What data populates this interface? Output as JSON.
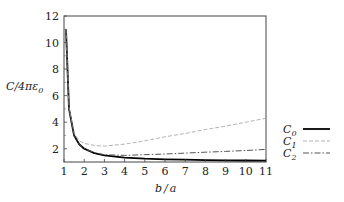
{
  "chart_data": {
    "type": "line",
    "title": "",
    "xlabel": "b/a",
    "ylabel": "C/4πε0",
    "xlim": [
      1,
      11
    ],
    "ylim": [
      1,
      12
    ],
    "grid": false,
    "legend_position": "right",
    "xticks": [
      1,
      2,
      3,
      4,
      5,
      6,
      7,
      8,
      9,
      10,
      11
    ],
    "yticks": [
      2,
      4,
      6,
      8,
      10,
      12
    ],
    "x": [
      1.1,
      1.25,
      1.5,
      1.75,
      2,
      2.5,
      3,
      4,
      5,
      6,
      7,
      8,
      9,
      10,
      11
    ],
    "series": [
      {
        "name": "C0",
        "style": "solid",
        "color": "#000000",
        "values": [
          11.0,
          5.0,
          3.0,
          2.33,
          2.0,
          1.67,
          1.5,
          1.33,
          1.25,
          1.2,
          1.17,
          1.14,
          1.13,
          1.11,
          1.1
        ]
      },
      {
        "name": "C1",
        "style": "dashed",
        "color": "#aaaaaa",
        "values": [
          11.0,
          5.1,
          3.2,
          2.6,
          2.4,
          2.25,
          2.2,
          2.35,
          2.6,
          2.9,
          3.15,
          3.45,
          3.7,
          4.0,
          4.3
        ]
      },
      {
        "name": "C2",
        "style": "dashdot",
        "color": "#555555",
        "values": [
          11.0,
          5.0,
          3.0,
          2.35,
          2.02,
          1.7,
          1.55,
          1.5,
          1.55,
          1.6,
          1.67,
          1.74,
          1.8,
          1.87,
          1.95
        ]
      }
    ]
  },
  "axes": {
    "xlabel_b": "b",
    "xlabel_slash": "/",
    "xlabel_a": "a",
    "ylabel_text": "C/4πε",
    "ylabel_sub": "0"
  },
  "legend": [
    {
      "label": "C",
      "sub": "0"
    },
    {
      "label": "C",
      "sub": "1"
    },
    {
      "label": "C",
      "sub": "2"
    }
  ]
}
